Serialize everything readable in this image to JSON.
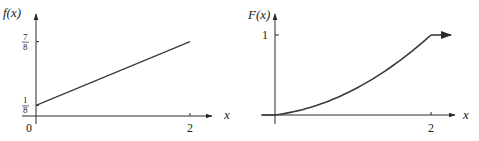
{
  "chart_data": [
    {
      "type": "line",
      "title": "",
      "ylabel": "f(x)",
      "xlabel": "x",
      "origin_label": "0",
      "xlim": [
        0,
        2
      ],
      "ylim": [
        0,
        1
      ],
      "x_ticks": [
        {
          "value": 2,
          "label": "2"
        }
      ],
      "y_ticks": [
        {
          "value": 0.125,
          "num": "1",
          "den": "8"
        },
        {
          "value": 0.875,
          "num": "7",
          "den": "8"
        }
      ],
      "series": [
        {
          "name": "f(x)",
          "x": [
            0,
            2
          ],
          "y": [
            0.125,
            0.875
          ],
          "formula": "f(x) = 1/8 + 3x/8"
        }
      ],
      "grid": false,
      "legend": "none"
    },
    {
      "type": "line",
      "title": "",
      "ylabel": "F(x)",
      "xlabel": "x",
      "xlim": [
        0,
        2
      ],
      "ylim": [
        0,
        1
      ],
      "x_ticks": [
        {
          "value": 2,
          "label": "2"
        }
      ],
      "y_ticks": [
        {
          "value": 1,
          "label": "1"
        }
      ],
      "series": [
        {
          "name": "F(x)",
          "x": [
            0,
            0.5,
            1,
            1.5,
            2
          ],
          "y": [
            0,
            0.109,
            0.3125,
            0.609,
            1
          ],
          "formula": "F(x) = x/8 + 3x^2/16",
          "continues_at": 1
        }
      ],
      "grid": false,
      "legend": "none"
    }
  ]
}
